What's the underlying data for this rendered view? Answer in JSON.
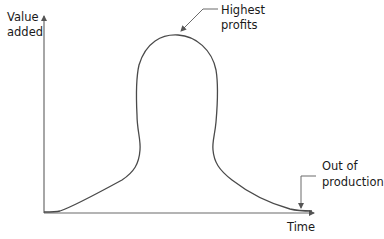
{
  "diagram": {
    "y_axis_label": [
      "Value",
      "added"
    ],
    "x_axis_label": "Time",
    "annotations": {
      "peak": [
        "Highest",
        "profits"
      ],
      "end": [
        "Out of",
        "production"
      ]
    },
    "colors": {
      "background": "#ffffff",
      "curve": "#4a4a4a",
      "axis": "#6b6b6b",
      "text": "#1a1a1a"
    }
  }
}
